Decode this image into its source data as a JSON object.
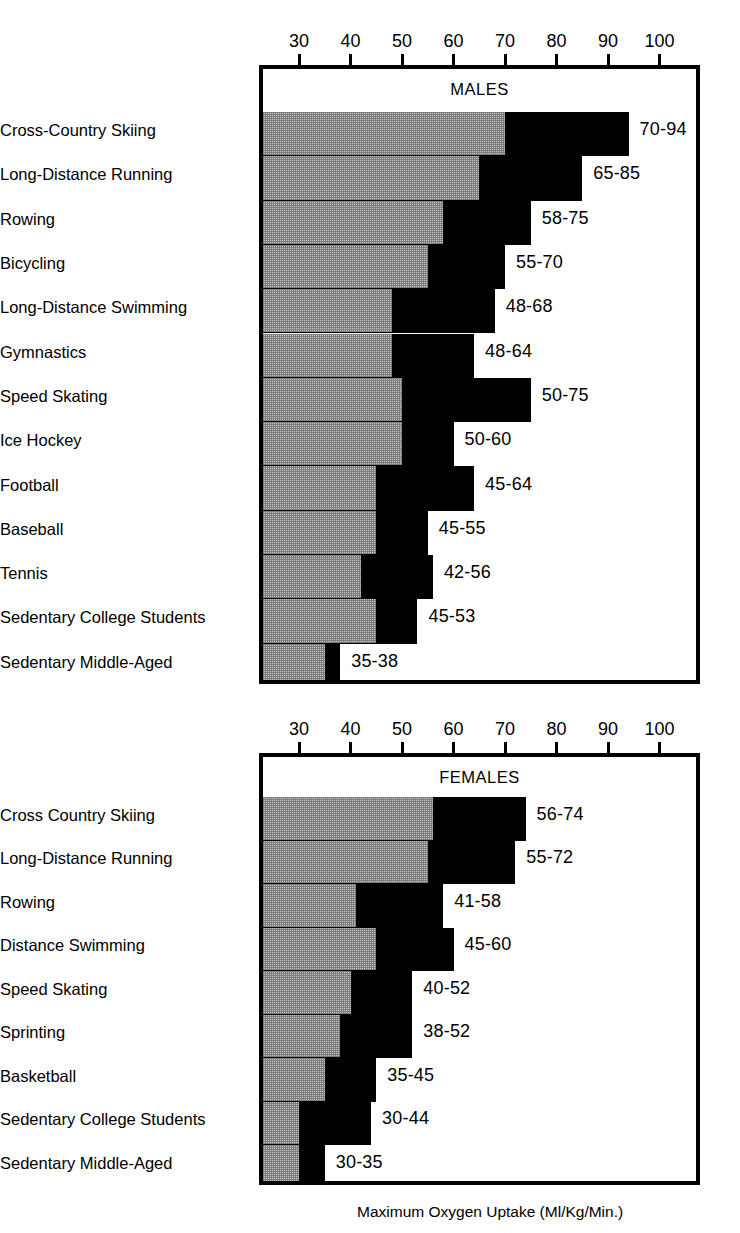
{
  "figure": {
    "caption": "Maximum Oxygen Uptake (Ml/Kg/Min.)",
    "ink_color": "#000000",
    "low_band_color": "#c9c9c9",
    "high_band_color": "#000000"
  },
  "chart_data": [
    {
      "type": "bar",
      "title": "MALES",
      "xlabel": "Maximum Oxygen Uptake (Ml/Kg/Min.)",
      "ylabel": "",
      "orientation": "horizontal",
      "range_bars": true,
      "grid": false,
      "legend": "none",
      "xlim": [
        22.3,
        107.9
      ],
      "xticks": [
        30,
        40,
        50,
        60,
        70,
        80,
        90,
        100
      ],
      "xtick_labels": [
        "30",
        "40",
        "50",
        "60",
        "70",
        "80",
        "90",
        "100"
      ],
      "categories": [
        "Cross-Country Skiing",
        "Long-Distance Running",
        "Rowing",
        "Bicycling",
        "Long-Distance Swimming",
        "Gymnastics",
        "Speed Skating",
        "Ice Hockey",
        "Football",
        "Baseball",
        "Tennis",
        "Sedentary College Students",
        "Sedentary Middle-Aged"
      ],
      "low": [
        70,
        65,
        58,
        55,
        48,
        48,
        50,
        50,
        45,
        45,
        42,
        45,
        35
      ],
      "high": [
        94,
        85,
        75,
        70,
        68,
        64,
        75,
        60,
        64,
        55,
        56,
        53,
        38
      ],
      "value_labels": [
        "70-94",
        "65-85",
        "58-75",
        "55-70",
        "48-68",
        "48-64",
        "50-75",
        "50-60",
        "45-64",
        "45-55",
        "42-56",
        "45-53",
        "35-38"
      ]
    },
    {
      "type": "bar",
      "title": "FEMALES",
      "xlabel": "Maximum Oxygen Uptake (Ml/Kg/Min.)",
      "ylabel": "",
      "orientation": "horizontal",
      "range_bars": true,
      "grid": false,
      "legend": "none",
      "xlim": [
        22.3,
        107.9
      ],
      "xticks": [
        30,
        40,
        50,
        60,
        70,
        80,
        90,
        100
      ],
      "xtick_labels": [
        "30",
        "40",
        "50",
        "60",
        "70",
        "80",
        "90",
        "100"
      ],
      "categories": [
        "Cross Country Skiing",
        "Long-Distance Running",
        "Rowing",
        "Distance Swimming",
        "Speed Skating",
        "Sprinting",
        "Basketball",
        "Sedentary College Students",
        "Sedentary Middle-Aged"
      ],
      "low": [
        56,
        55,
        41,
        45,
        40,
        38,
        35,
        30,
        30
      ],
      "high": [
        74,
        72,
        58,
        60,
        52,
        52,
        45,
        44,
        35
      ],
      "value_labels": [
        "56-74",
        "55-72",
        "41-58",
        "45-60",
        "40-52",
        "38-52",
        "35-45",
        "30-44",
        "30-35"
      ]
    }
  ]
}
